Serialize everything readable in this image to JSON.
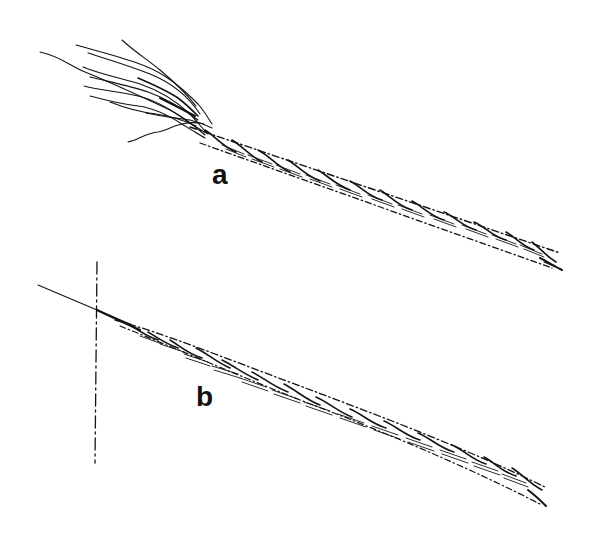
{
  "figure": {
    "type": "line-illustration",
    "background_color": "#ffffff",
    "ink_color": "#141414",
    "panels": [
      {
        "id": "a",
        "label": "a",
        "description": "Twisted strand with frayed, untwisted fibres at left end"
      },
      {
        "id": "b",
        "label": "b",
        "description": "Twisted strand tapering to a single thread crossing a vertical dash-dot reference line"
      }
    ]
  }
}
